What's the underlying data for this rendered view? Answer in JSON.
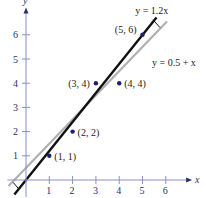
{
  "chart_data": {
    "type": "scatter",
    "title": "",
    "xlabel": "x",
    "ylabel": "y",
    "xlim": [
      -0.8,
      7
    ],
    "ylim": [
      -0.6,
      7
    ],
    "grid": false,
    "x_ticks": [
      "1",
      "2",
      "3",
      "4",
      "5",
      "6"
    ],
    "y_ticks": [
      "1",
      "2",
      "3",
      "4",
      "5",
      "6"
    ],
    "points": [
      {
        "x": 1,
        "y": 1,
        "label": "(1, 1)"
      },
      {
        "x": 2,
        "y": 2,
        "label": "(2, 2)"
      },
      {
        "x": 3,
        "y": 4,
        "label": "(3, 4)"
      },
      {
        "x": 4,
        "y": 4,
        "label": "(4, 4)"
      },
      {
        "x": 5,
        "y": 6,
        "label": "(5, 6)"
      }
    ],
    "lines": [
      {
        "name": "y = 1.2x",
        "slope": 1.2,
        "intercept": 0,
        "color": "#111111"
      },
      {
        "name": "y = 0.5 + x",
        "slope": 1,
        "intercept": 0.5,
        "color": "#b0b0b0"
      }
    ],
    "colors": {
      "axis": "#8a8fc0",
      "point": "#1a2070"
    }
  }
}
